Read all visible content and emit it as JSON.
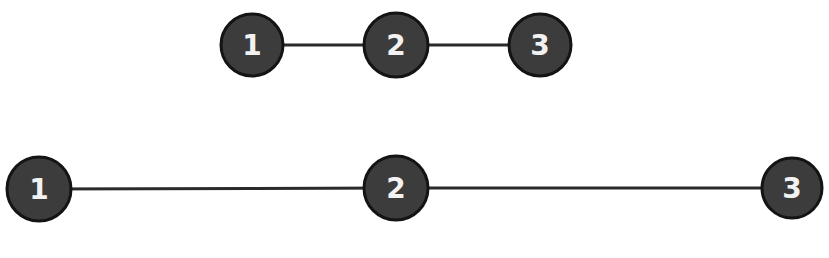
{
  "colors": {
    "node_fill": "#3c3c3c",
    "node_stroke": "#141414",
    "edge": "#2a2a2a",
    "label": "#f2f2f2",
    "background": "#ffffff"
  },
  "diagrams": [
    {
      "name": "compact-chain",
      "nodes": [
        {
          "label": "1",
          "cx": 252,
          "cy": 45,
          "r": 31
        },
        {
          "label": "2",
          "cx": 396,
          "cy": 45,
          "r": 32
        },
        {
          "label": "3",
          "cx": 540,
          "cy": 45,
          "r": 31
        }
      ],
      "edges": [
        [
          "1",
          "2"
        ],
        [
          "2",
          "3"
        ]
      ]
    },
    {
      "name": "spread-chain",
      "nodes": [
        {
          "label": "1",
          "cx": 39,
          "cy": 189,
          "r": 32
        },
        {
          "label": "2",
          "cx": 396,
          "cy": 188,
          "r": 32
        },
        {
          "label": "3",
          "cx": 792,
          "cy": 188,
          "r": 30
        }
      ],
      "edges": [
        [
          "1",
          "2"
        ],
        [
          "2",
          "3"
        ]
      ]
    }
  ]
}
